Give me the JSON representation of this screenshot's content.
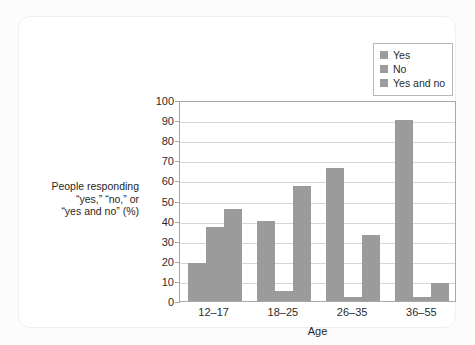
{
  "chart_data": {
    "type": "bar",
    "title": "",
    "subtitle": "",
    "xlabel": "Age",
    "ylabel": "People responding “yes,” “no,” or “yes and no” (%)",
    "ylabel_lines": [
      "People responding",
      "“yes,” “no,” or",
      "“yes and no” (%)"
    ],
    "categories": [
      "12–17",
      "18–25",
      "26–35",
      "36–55"
    ],
    "series": [
      {
        "name": "Yes",
        "values": [
          19,
          40,
          66,
          90
        ],
        "color": "#9b9b9b"
      },
      {
        "name": "No",
        "values": [
          37,
          5,
          2,
          2
        ],
        "color": "#9b9b9b"
      },
      {
        "name": "Yes and no",
        "values": [
          46,
          57,
          33,
          9
        ],
        "color": "#9b9b9b"
      }
    ],
    "ylim": [
      0,
      100
    ],
    "ytick_values": [
      0,
      10,
      20,
      30,
      40,
      50,
      60,
      70,
      80,
      90,
      100
    ],
    "ytick_labels": [
      "0",
      "10",
      "20",
      "30",
      "40",
      "50",
      "60",
      "70",
      "80",
      "90",
      "100"
    ],
    "grid": true,
    "grid_axis": "y",
    "legend_position": "top-right",
    "legend_entries": [
      "Yes",
      "No",
      "Yes and no"
    ],
    "bar_color": "#9b9b9b",
    "grid_color": "#d6d6d6",
    "axis_color": "#a8a8a8",
    "plot_background": "#ffffff",
    "card_background": "#ffffff",
    "page_background": "#fcfcfc"
  }
}
